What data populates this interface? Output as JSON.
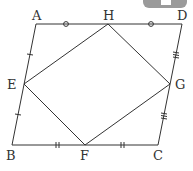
{
  "diagram": {
    "type": "parallelogram-with-midpoint-quadrilateral",
    "stroke_color": "#333333",
    "points": {
      "A": {
        "label": "A",
        "x": 36,
        "y": 24
      },
      "D": {
        "label": "D",
        "x": 182,
        "y": 24
      },
      "B": {
        "label": "B",
        "x": 12,
        "y": 145
      },
      "C": {
        "label": "C",
        "x": 158,
        "y": 145
      },
      "H": {
        "label": "H",
        "x": 108,
        "y": 24
      },
      "E": {
        "label": "E",
        "x": 24,
        "y": 84
      },
      "G": {
        "label": "G",
        "x": 170,
        "y": 84
      },
      "F": {
        "label": "F",
        "x": 85,
        "y": 145
      }
    },
    "outer_shape": [
      "A",
      "D",
      "C",
      "B"
    ],
    "inner_shape": [
      "H",
      "G",
      "F",
      "E"
    ],
    "tick_marks": {
      "AH_HD": "circle",
      "AE_EB": "single-tick",
      "BF_FC": "double-tick",
      "DG_GC": "triple-tick"
    }
  }
}
